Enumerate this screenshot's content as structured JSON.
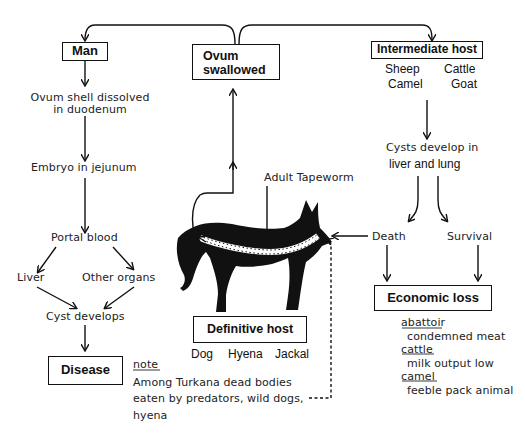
{
  "diagram": {
    "boxes": {
      "man": "Man",
      "ovum_swallowed_line1": "Ovum",
      "ovum_swallowed_line2": "swallowed",
      "intermediate_host": "Intermediate host",
      "definitive_host": "Definitive host",
      "disease": "Disease",
      "economic_loss": "Economic loss"
    },
    "man_path": {
      "step1_line1": "Ovum shell dissolved",
      "step1_line2": "in duodenum",
      "step2": "Embryo in jejunum",
      "step3": "Portal blood",
      "branch_left": "Liver",
      "branch_right": "Other organs",
      "step4": "Cyst develops"
    },
    "intermediate_hosts": {
      "row1_left": "Sheep",
      "row1_right": "Cattle",
      "row2_left": "Camel",
      "row2_right": "Goat"
    },
    "intermediate_path": {
      "cysts_line1": "Cysts develop in",
      "cysts_line2": "liver and lung",
      "outcome_left": "Death",
      "outcome_right": "Survival"
    },
    "definitive_hosts": {
      "dog": "Dog",
      "hyena": "Hyena",
      "jackal": "Jackal"
    },
    "adult_tapeworm_label": "Adult Tapeworm",
    "economic_loss_details": [
      {
        "heading": "abattoir",
        "detail": "condemned meat"
      },
      {
        "heading": "cattle",
        "detail": "milk output low"
      },
      {
        "heading": "camel",
        "detail": "feeble pack animal"
      }
    ],
    "note": {
      "heading": "note",
      "line1": "Among Turkana dead bodies",
      "line2": "eaten by predators, wild dogs,",
      "line3": "hyena"
    },
    "colors": {
      "ink": "#111111",
      "background": "#ffffff"
    }
  }
}
